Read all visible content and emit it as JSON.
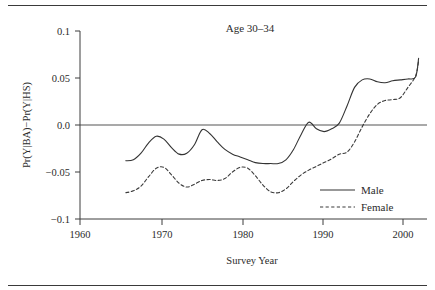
{
  "chart_data": {
    "type": "line",
    "title": "Age 30–34",
    "xlabel": "Survey Year",
    "ylabel": "Pr(Y|BA)−Pr(Y|HS)",
    "xlim": [
      1958,
      2003.5
    ],
    "ylim": [
      -0.1,
      0.1
    ],
    "grid": false,
    "legend_position": "lower-right",
    "xticks": [
      1960,
      1970,
      1980,
      1990,
      2000
    ],
    "xtick_labels": [
      "1960",
      "1970",
      "1980",
      "1990",
      "2000"
    ],
    "yticks": [
      0.1,
      0.05,
      0.0,
      -0.05,
      -0.1
    ],
    "ytick_labels": [
      "0.1",
      "0.05",
      "0.0",
      "−0.05",
      "−0.1"
    ],
    "zero_reference_line": 0.0,
    "series": [
      {
        "name": "Male",
        "style": "solid",
        "color": "#333333",
        "x": [
          1964,
          1965,
          1966,
          1967,
          1968,
          1969,
          1970,
          1971,
          1972,
          1973,
          1974,
          1975,
          1976,
          1977,
          1978,
          1979,
          1980,
          1981,
          1982,
          1983,
          1984,
          1985,
          1986,
          1987,
          1988,
          1989,
          1990,
          1991,
          1992,
          1993,
          1994,
          1995,
          1996,
          1997,
          1998,
          1999,
          2000,
          2001,
          2002
        ],
        "values": [
          -0.038,
          -0.037,
          -0.03,
          -0.019,
          -0.012,
          -0.015,
          -0.024,
          -0.031,
          -0.03,
          -0.021,
          -0.005,
          -0.009,
          -0.018,
          -0.026,
          -0.031,
          -0.034,
          -0.037,
          -0.04,
          -0.041,
          -0.041,
          -0.041,
          -0.037,
          -0.026,
          -0.01,
          0.003,
          -0.004,
          -0.007,
          -0.004,
          0.002,
          0.02,
          0.04,
          0.048,
          0.049,
          0.046,
          0.045,
          0.047,
          0.048,
          0.049,
          0.051
        ]
      },
      {
        "name": "Female",
        "style": "dashed",
        "color": "#3b3b3b",
        "x": [
          1964,
          1965,
          1966,
          1967,
          1968,
          1969,
          1970,
          1971,
          1972,
          1973,
          1974,
          1975,
          1976,
          1977,
          1978,
          1979,
          1980,
          1981,
          1982,
          1983,
          1984,
          1985,
          1986,
          1987,
          1988,
          1989,
          1990,
          1991,
          1992,
          1993,
          1994,
          1995,
          1996,
          1997,
          1998,
          1999,
          2000,
          2001,
          2002
        ],
        "values": [
          -0.072,
          -0.07,
          -0.065,
          -0.055,
          -0.046,
          -0.045,
          -0.053,
          -0.062,
          -0.066,
          -0.063,
          -0.059,
          -0.058,
          -0.059,
          -0.057,
          -0.05,
          -0.045,
          -0.046,
          -0.054,
          -0.064,
          -0.071,
          -0.072,
          -0.068,
          -0.06,
          -0.053,
          -0.048,
          -0.044,
          -0.04,
          -0.036,
          -0.031,
          -0.029,
          -0.018,
          -0.002,
          0.012,
          0.022,
          0.026,
          0.027,
          0.029,
          0.04,
          0.052
        ]
      }
    ],
    "male_end_value": 0.071,
    "female_end_value": 0.068,
    "male_end_x": 2002.4,
    "female_end_x": 2002.4
  },
  "legend": {
    "entries": [
      {
        "label": "Male",
        "style": "solid"
      },
      {
        "label": "Female",
        "style": "dashed"
      }
    ]
  }
}
